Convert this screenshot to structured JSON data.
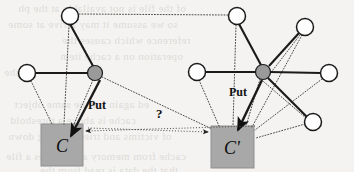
{
  "figure": {
    "background_color": "#f4f3f1",
    "node_fill_white": "#ffffff",
    "node_fill_hub": "#9a9a9a",
    "node_stroke": "#1a1a1a",
    "box_fill": "#a8a8a8",
    "box_stroke": "#8f8f8f",
    "solid_edge_color": "#1a1a1a",
    "dotted_edge_color": "#4a4a4a"
  },
  "labels": {
    "put_left": "Put",
    "put_right": "Put",
    "question": "?",
    "cache_left": "C",
    "cache_right": "C'"
  },
  "nodes": [
    {
      "id": "n-top-left",
      "name": "client-node-top-left",
      "cx": 70,
      "cy": 16,
      "r": 8.5,
      "kind": "white"
    },
    {
      "id": "n-far-left",
      "name": "client-node-far-left",
      "cx": 27,
      "cy": 73,
      "r": 8.5,
      "kind": "white"
    },
    {
      "id": "n-hub-left",
      "name": "server-hub-left",
      "cx": 95,
      "cy": 73,
      "r": 7.5,
      "kind": "hub"
    },
    {
      "id": "n-top-right",
      "name": "client-node-top-right",
      "cx": 237,
      "cy": 16,
      "r": 8.5,
      "kind": "white"
    },
    {
      "id": "n-mid-left-r",
      "name": "client-node-left-of-hub-right",
      "cx": 197,
      "cy": 72,
      "r": 8.5,
      "kind": "white"
    },
    {
      "id": "n-hub-right",
      "name": "server-hub-right",
      "cx": 263,
      "cy": 72,
      "r": 7.5,
      "kind": "hub"
    },
    {
      "id": "n-upper-right",
      "name": "client-node-upper-right",
      "cx": 305,
      "cy": 27,
      "r": 8.5,
      "kind": "white"
    },
    {
      "id": "n-far-right",
      "name": "client-node-far-right",
      "cx": 329,
      "cy": 73,
      "r": 8.5,
      "kind": "white"
    },
    {
      "id": "n-lower-right",
      "name": "client-node-lower-right",
      "cx": 313,
      "cy": 122,
      "r": 8.5,
      "kind": "white"
    }
  ],
  "boxes": [
    {
      "id": "box-c",
      "name": "cache-box-c",
      "x": 41,
      "y": 124,
      "w": 42,
      "h": 42,
      "label_key": "cache_left",
      "label_x": 62,
      "label_y": 152
    },
    {
      "id": "box-c-prime",
      "name": "cache-box-c-prime",
      "x": 211,
      "y": 126,
      "w": 43,
      "h": 42,
      "label_key": "cache_right",
      "label_x": 232,
      "label_y": 154
    }
  ],
  "solid_edges": [
    {
      "name": "edge-top-left-to-hub-left",
      "x1": 70,
      "y1": 24,
      "x2": 93,
      "y2": 66
    },
    {
      "name": "edge-far-left-to-hub-left",
      "x1": 35,
      "y1": 73,
      "x2": 88,
      "y2": 73
    },
    {
      "name": "edge-top-right-to-hub-right",
      "x1": 239,
      "y1": 24,
      "x2": 261,
      "y2": 65
    },
    {
      "name": "edge-mid-left-to-hub-right",
      "x1": 205,
      "y1": 72,
      "x2": 256,
      "y2": 72
    },
    {
      "name": "edge-upper-right-to-hub-right",
      "x1": 299,
      "y1": 33,
      "x2": 269,
      "y2": 66
    },
    {
      "name": "edge-far-right-to-hub-right",
      "x1": 321,
      "y1": 73,
      "x2": 270,
      "y2": 72
    },
    {
      "name": "edge-lower-right-to-hub-right",
      "x1": 307,
      "y1": 117,
      "x2": 268,
      "y2": 78
    }
  ],
  "arrows": [
    {
      "name": "put-arrow-left",
      "x1": 100,
      "y1": 80,
      "x2": 71,
      "y2": 136,
      "style": "solid"
    },
    {
      "name": "put-arrow-right",
      "x1": 262,
      "y1": 80,
      "x2": 238,
      "y2": 130,
      "style": "solid"
    },
    {
      "name": "invalidate-arrow-to-c",
      "x1": 255,
      "y1": 126,
      "x2": 86,
      "y2": 131,
      "style": "dotted"
    },
    {
      "name": "invalidate-arrow-to-c-prime",
      "x1": 88,
      "y1": 128,
      "x2": 208,
      "y2": 132,
      "style": "dotted"
    }
  ],
  "dotted_edges": [
    {
      "name": "dotted-top-left-to-top-right",
      "x1": 79,
      "y1": 14,
      "x2": 228,
      "y2": 15
    },
    {
      "name": "dotted-top-left-to-c",
      "x1": 69,
      "y1": 25,
      "x2": 64,
      "y2": 124
    },
    {
      "name": "dotted-far-left-to-c",
      "x1": 31,
      "y1": 81,
      "x2": 52,
      "y2": 124
    },
    {
      "name": "dotted-hub-left-to-c",
      "x1": 93,
      "y1": 80,
      "x2": 74,
      "y2": 124
    },
    {
      "name": "dotted-hub-left-to-c-prime",
      "x1": 102,
      "y1": 77,
      "x2": 212,
      "y2": 129
    },
    {
      "name": "dotted-top-right-to-c-prime",
      "x1": 236,
      "y1": 25,
      "x2": 233,
      "y2": 126
    },
    {
      "name": "dotted-mid-left-to-c-prime",
      "x1": 199,
      "y1": 80,
      "x2": 219,
      "y2": 126
    },
    {
      "name": "dotted-hub-right-to-c-prime",
      "x1": 260,
      "y1": 79,
      "x2": 246,
      "y2": 126
    },
    {
      "name": "dotted-upper-right-to-c-prime",
      "x1": 302,
      "y1": 35,
      "x2": 252,
      "y2": 127
    },
    {
      "name": "dotted-far-right-to-c-prime",
      "x1": 322,
      "y1": 79,
      "x2": 255,
      "y2": 130
    },
    {
      "name": "dotted-lower-right-to-c-prime",
      "x1": 305,
      "y1": 124,
      "x2": 256,
      "y2": 138
    },
    {
      "name": "dotted-upper-right-to-hub-right",
      "x1": 300,
      "y1": 35,
      "x2": 266,
      "y2": 79
    },
    {
      "name": "dotted-hub-right-to-lower-right",
      "x1": 257,
      "y1": 76,
      "x2": 306,
      "y2": 118
    }
  ],
  "label_positions": {
    "put_left": {
      "x": 88,
      "y": 98
    },
    "put_right": {
      "x": 229,
      "y": 85
    },
    "question": {
      "x": 156,
      "y": 106
    }
  },
  "ghost_text": [
    {
      "text": "of the file is not available at the ph",
      "x": 18,
      "y": 2,
      "size": 11
    },
    {
      "text": "so we assume it may arrive at some",
      "x": 8,
      "y": 18,
      "size": 11
    },
    {
      "text": "reference which causes the",
      "x": 62,
      "y": 34,
      "size": 11
    },
    {
      "text": "operation on a cache item",
      "x": 60,
      "y": 50,
      "size": 11
    },
    {
      "text": "the",
      "x": 4,
      "y": 66,
      "size": 11
    },
    {
      "text": "ed again for the same object",
      "x": 14,
      "y": 98,
      "size": 11
    },
    {
      "text": "cache is above a threshold",
      "x": 10,
      "y": 114,
      "size": 11
    },
    {
      "text": "of victims and tries evicting down",
      "x": 8,
      "y": 130,
      "size": 11
    },
    {
      "text": "cache from memory and creates a file",
      "x": 6,
      "y": 150,
      "size": 11
    },
    {
      "text": "that the data is read from the",
      "x": 40,
      "y": 164,
      "size": 11
    }
  ]
}
